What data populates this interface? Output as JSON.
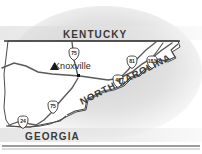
{
  "figure": {
    "type": "locator-map",
    "region": "East Tennessee",
    "background_color": "#ffffff",
    "line_color": "#3a3a3a",
    "shadow_color": "#d8d8d8"
  },
  "states": [
    {
      "id": "kentucky",
      "name": "KENTUCKY",
      "position": "north"
    },
    {
      "id": "north_carolina",
      "name": "NORTH CAROLINA",
      "position": "southeast",
      "rotation_deg": -27
    },
    {
      "id": "georgia",
      "name": "GEORGIA",
      "position": "south"
    }
  ],
  "cities": [
    {
      "id": "knoxville",
      "name": "Knoxville",
      "marker": "triangle-marker",
      "dot": "city-dot"
    }
  ],
  "highway_shields": [
    {
      "id": "i75-north",
      "number": "75",
      "x": 74,
      "y": 54
    },
    {
      "id": "i81",
      "number": "81",
      "x": 132,
      "y": 62
    },
    {
      "id": "i181",
      "number": "181",
      "x": 152,
      "y": 62
    },
    {
      "id": "i40",
      "number": "40",
      "x": 118,
      "y": 81
    },
    {
      "id": "i75-south",
      "number": "75",
      "x": 53,
      "y": 107
    },
    {
      "id": "i24",
      "number": "24",
      "x": 23,
      "y": 122
    }
  ],
  "frame": {
    "bottom_rule": true
  }
}
